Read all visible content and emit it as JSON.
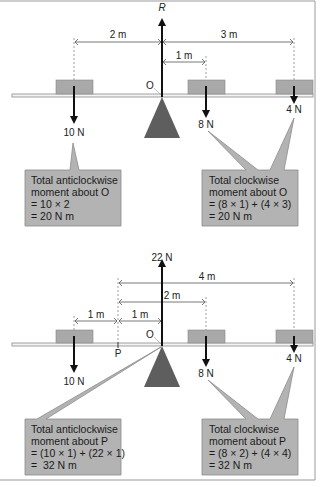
{
  "colors": {
    "beam_fill": "#f4f4f4",
    "beam_stroke": "#8a8a8a",
    "block_fill": "#a9a9a9",
    "block_stroke": "#888888",
    "pivot_fill": "#5e5e5e",
    "callout_fill": "#b3b3b3",
    "callout_stroke": "#8c8c8c",
    "arrow": "#111111",
    "dim_line": "#555555",
    "frame": "#9a9a9a"
  },
  "top_diagram": {
    "reaction_label": "R",
    "pivot_label": "O",
    "dimensions": [
      {
        "label": "2 m"
      },
      {
        "label": "3 m"
      },
      {
        "label": "1 m"
      }
    ],
    "forces": [
      {
        "label": "10 N"
      },
      {
        "label": "8 N"
      },
      {
        "label": "4 N"
      }
    ],
    "callout_left": {
      "lines": [
        "Total anticlockwise",
        "moment about O",
        "= 10 × 2",
        "= 20 N m"
      ]
    },
    "callout_right": {
      "lines": [
        "Total clockwise",
        "moment about O",
        "= (8 × 1) + (4 × 3)",
        "= 20 N m"
      ]
    }
  },
  "bottom_diagram": {
    "reaction_label": "22 N",
    "pivot_label": "O",
    "point_label": "P",
    "dimensions": [
      {
        "label": "4 m"
      },
      {
        "label": "2 m"
      },
      {
        "label": "1 m"
      },
      {
        "label": "1 m"
      }
    ],
    "forces": [
      {
        "label": "10 N"
      },
      {
        "label": "8 N"
      },
      {
        "label": "4 N"
      }
    ],
    "callout_left": {
      "lines": [
        "Total anticlockwise",
        "moment about P",
        "= (10 × 1) + (22 × 1)",
        "=  32 N m"
      ]
    },
    "callout_right": {
      "lines": [
        "Total clockwise",
        "moment about P",
        "= (8 × 2) + (4 × 4)",
        "= 32 N m"
      ]
    }
  }
}
